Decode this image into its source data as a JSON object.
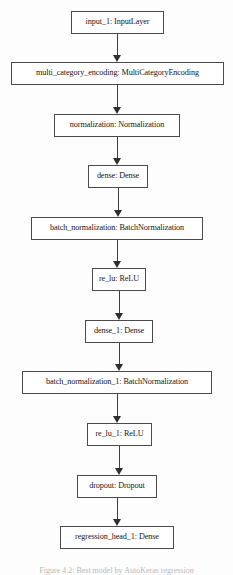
{
  "figure": {
    "type": "neural-network-layer-graph",
    "orientation": "top-to-bottom",
    "caption": "Figure 4.2: Best model by AutoKeras regression",
    "nodes": [
      {
        "id": "input_1",
        "label": "input_1: InputLayer",
        "layer_name": "input_1",
        "layer_type": "InputLayer",
        "x": 71,
        "y": 11,
        "w": 93,
        "h": 23
      },
      {
        "id": "multi_category_encoding",
        "label": "multi_category_encoding: MultiCategoryEncoding",
        "layer_name": "multi_category_encoding",
        "layer_type": "MultiCategoryEncoding",
        "x": 11,
        "y": 62,
        "w": 213,
        "h": 23
      },
      {
        "id": "normalization",
        "label": "normalization: Normalization",
        "layer_name": "normalization",
        "layer_type": "Normalization",
        "x": 54,
        "y": 114,
        "w": 126,
        "h": 23
      },
      {
        "id": "dense",
        "label": "dense: Dense",
        "layer_name": "dense",
        "layer_type": "Dense",
        "x": 88,
        "y": 165,
        "w": 60,
        "h": 23
      },
      {
        "id": "batch_normalization",
        "label": "batch_normalization: BatchNormalization",
        "layer_name": "batch_normalization",
        "layer_type": "BatchNormalization",
        "x": 31,
        "y": 217,
        "w": 172,
        "h": 23
      },
      {
        "id": "re_lu",
        "label": "re_lu: ReLU",
        "layer_name": "re_lu",
        "layer_type": "ReLU",
        "x": 92,
        "y": 268,
        "w": 54,
        "h": 23
      },
      {
        "id": "dense_1",
        "label": "dense_1: Dense",
        "layer_name": "dense_1",
        "layer_type": "Dense",
        "x": 85,
        "y": 320,
        "w": 68,
        "h": 23
      },
      {
        "id": "batch_normalization_1",
        "label": "batch_normalization_1: BatchNormalization",
        "layer_name": "batch_normalization_1",
        "layer_type": "BatchNormalization",
        "x": 22,
        "y": 371,
        "w": 190,
        "h": 23
      },
      {
        "id": "re_lu_1",
        "label": "re_lu_1: ReLU",
        "layer_name": "re_lu_1",
        "layer_type": "ReLU",
        "x": 87,
        "y": 423,
        "w": 65,
        "h": 23
      },
      {
        "id": "dropout",
        "label": "dropout: Dropout",
        "layer_name": "dropout",
        "layer_type": "Dropout",
        "x": 77,
        "y": 475,
        "w": 80,
        "h": 23
      },
      {
        "id": "regression_head_1",
        "label": "regression_head_1: Dense",
        "layer_name": "regression_head_1",
        "layer_type": "Dense",
        "x": 60,
        "y": 526,
        "w": 114,
        "h": 23
      }
    ],
    "edges": [
      {
        "from": "input_1",
        "to": "multi_category_encoding"
      },
      {
        "from": "multi_category_encoding",
        "to": "normalization"
      },
      {
        "from": "normalization",
        "to": "dense"
      },
      {
        "from": "dense",
        "to": "batch_normalization"
      },
      {
        "from": "batch_normalization",
        "to": "re_lu"
      },
      {
        "from": "re_lu",
        "to": "dense_1"
      },
      {
        "from": "dense_1",
        "to": "batch_normalization_1"
      },
      {
        "from": "batch_normalization_1",
        "to": "re_lu_1"
      },
      {
        "from": "re_lu_1",
        "to": "dropout"
      },
      {
        "from": "dropout",
        "to": "regression_head_1"
      }
    ],
    "colors": {
      "background": "#fdfdfd",
      "node_fill": "#ffffff",
      "node_border": "#4a4a4a",
      "edge": "#3d3d3d",
      "text": "#161616"
    }
  }
}
